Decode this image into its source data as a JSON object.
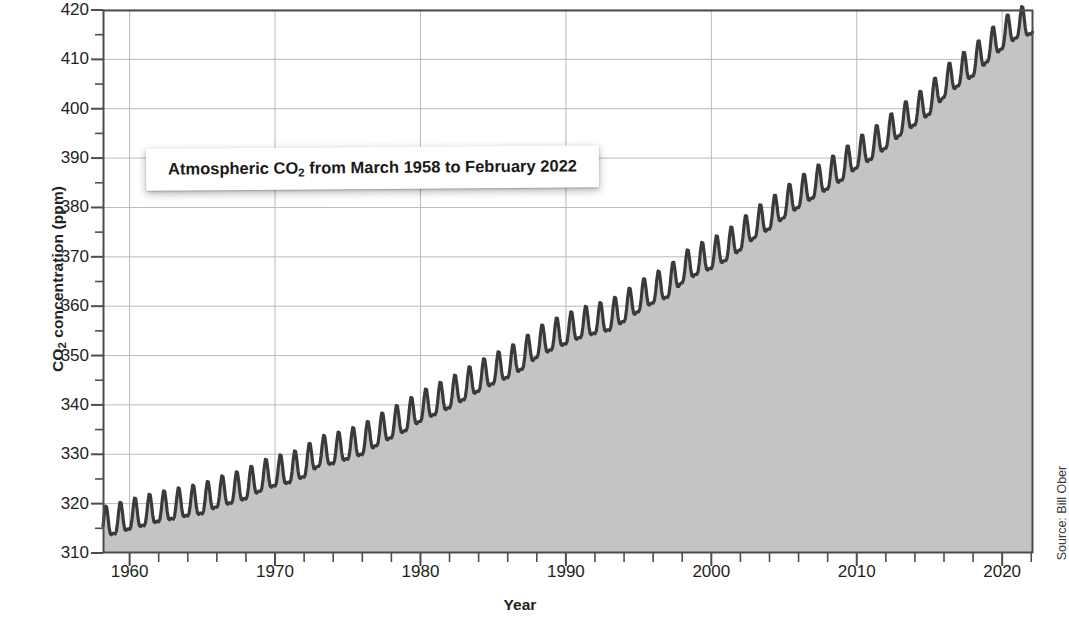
{
  "figure": {
    "title": "Atmospheric CO2 from March 1958 to February 2022",
    "title_prefix": "Atmospheric CO",
    "title_sub": "2",
    "title_suffix": " from March 1958 to February 2022",
    "source": "Source: Bill Ober",
    "ylabel_prefix": "CO",
    "ylabel_sub": "2",
    "ylabel_suffix": " concentration (ppm)",
    "xlabel": "Year",
    "line_color": "#3a3a3a",
    "fill_color": "#c4c4c4",
    "grid_color": "#b9b9b9",
    "axis_color": "#4d4d4d"
  },
  "chart_data": {
    "type": "area",
    "title": "Atmospheric CO2 from March 1958 to February 2022",
    "xlabel": "Year",
    "ylabel": "CO2 concentration (ppm)",
    "xlim": [
      1958.17,
      2022.12
    ],
    "ylim": [
      310,
      420
    ],
    "grid": true,
    "legend": false,
    "ytick_labels": [
      "310",
      "320",
      "330",
      "340",
      "350",
      "360",
      "370",
      "380",
      "390",
      "400",
      "410",
      "420"
    ],
    "ytick_values": [
      310,
      320,
      330,
      340,
      350,
      360,
      370,
      380,
      390,
      400,
      410,
      420
    ],
    "ytick_minor_step": 5,
    "xtick_labels": [
      "1960",
      "1970",
      "1980",
      "1990",
      "2000",
      "2010",
      "2020"
    ],
    "xtick_values": [
      1960,
      1970,
      1980,
      1990,
      2000,
      2010,
      2020
    ],
    "xtick_minor_step": 2,
    "series_name": "Monthly mean atmospheric CO2 (Mauna Loa)",
    "annual_mean": {
      "years": [
        1958,
        1959,
        1960,
        1961,
        1962,
        1963,
        1964,
        1965,
        1966,
        1967,
        1968,
        1969,
        1970,
        1971,
        1972,
        1973,
        1974,
        1975,
        1976,
        1977,
        1978,
        1979,
        1980,
        1981,
        1982,
        1983,
        1984,
        1985,
        1986,
        1987,
        1988,
        1989,
        1990,
        1991,
        1992,
        1993,
        1994,
        1995,
        1996,
        1997,
        1998,
        1999,
        2000,
        2001,
        2002,
        2003,
        2004,
        2005,
        2006,
        2007,
        2008,
        2009,
        2010,
        2011,
        2012,
        2013,
        2014,
        2015,
        2016,
        2017,
        2018,
        2019,
        2020,
        2021,
        2022
      ],
      "values": [
        315.3,
        315.98,
        316.91,
        317.64,
        318.45,
        318.99,
        319.62,
        320.04,
        321.37,
        322.18,
        323.05,
        324.62,
        325.68,
        326.32,
        327.46,
        329.68,
        330.19,
        331.12,
        332.03,
        333.84,
        335.41,
        336.84,
        338.76,
        340.12,
        341.48,
        343.15,
        344.87,
        346.35,
        347.61,
        349.31,
        351.69,
        353.2,
        354.45,
        355.7,
        356.54,
        357.21,
        358.96,
        360.97,
        362.74,
        363.88,
        366.84,
        368.54,
        369.71,
        371.32,
        373.45,
        375.98,
        377.7,
        379.98,
        382.09,
        384.02,
        385.83,
        387.64,
        390.1,
        391.85,
        394.06,
        396.74,
        398.81,
        400.96,
        404.41,
        406.76,
        408.72,
        411.66,
        414.24,
        416.45,
        417.2
      ]
    },
    "seasonal_amplitude_ppm": 6.0,
    "seasonal_peak_month": "May",
    "seasonal_trough_month": "September",
    "start_value_ppm": 315.7,
    "end_value_ppm": 416.2,
    "total_increase_ppm": 100.5
  }
}
